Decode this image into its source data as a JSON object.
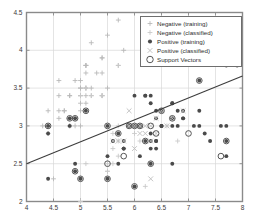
{
  "chart_data": {
    "type": "scatter",
    "title": "",
    "xlabel": "",
    "ylabel": "",
    "xlim": [
      4,
      8
    ],
    "ylim": [
      2,
      4.5
    ],
    "xticks": [
      4,
      4.5,
      5,
      5.5,
      6,
      6.5,
      7,
      7.5,
      8
    ],
    "xticklabels": [
      "4",
      "4.5",
      "5",
      "5.5",
      "6",
      "6.5",
      "7",
      "7.5",
      "8"
    ],
    "yticks": [
      2,
      2.5,
      3,
      3.5,
      4,
      4.5
    ],
    "yticklabels": [
      "2",
      "2.5",
      "3",
      "3.5",
      "4",
      "4.5"
    ],
    "grid": true,
    "legend_position": "upper right",
    "legend": [
      {
        "label": "Negative (training)",
        "marker": "plus",
        "color": "#b9b9b9"
      },
      {
        "label": "Negative (classified)",
        "marker": "plus",
        "color": "#c9c9c9"
      },
      {
        "label": "Positive (training)",
        "marker": "filled-circle",
        "color": "#4a4a4a"
      },
      {
        "label": "Positive (classified)",
        "marker": "cross",
        "color": "#bdbdbd"
      },
      {
        "label": "Support Vectors",
        "marker": "circle-outline",
        "color": "#555555"
      }
    ],
    "decision_boundary": {
      "type": "line",
      "x": [
        4,
        8
      ],
      "y": [
        2.5,
        3.66
      ],
      "color": "#3c3c3c"
    },
    "series": [
      {
        "name": "Negative (training)",
        "marker": "plus",
        "color": "#b9b9b9",
        "points": [
          [
            5.1,
            3.5
          ],
          [
            4.9,
            3.0
          ],
          [
            4.7,
            3.2
          ],
          [
            4.6,
            3.1
          ],
          [
            5.0,
            3.6
          ],
          [
            5.4,
            3.9
          ],
          [
            4.6,
            3.4
          ],
          [
            5.0,
            3.4
          ],
          [
            4.4,
            2.9
          ],
          [
            4.9,
            3.1
          ],
          [
            5.4,
            3.7
          ],
          [
            4.8,
            3.4
          ],
          [
            4.8,
            3.0
          ],
          [
            4.3,
            3.0
          ],
          [
            5.8,
            4.0
          ],
          [
            5.7,
            4.4
          ],
          [
            5.4,
            3.9
          ],
          [
            5.1,
            3.5
          ],
          [
            5.7,
            3.8
          ],
          [
            5.1,
            3.8
          ],
          [
            5.4,
            3.4
          ],
          [
            5.1,
            3.7
          ],
          [
            4.6,
            3.6
          ],
          [
            5.1,
            3.3
          ],
          [
            4.8,
            3.4
          ],
          [
            5.0,
            3.0
          ],
          [
            5.0,
            3.4
          ],
          [
            5.2,
            3.5
          ],
          [
            5.2,
            3.4
          ],
          [
            4.7,
            3.2
          ],
          [
            4.8,
            3.1
          ],
          [
            5.4,
            3.4
          ],
          [
            5.2,
            4.1
          ],
          [
            5.5,
            4.2
          ],
          [
            4.9,
            3.1
          ],
          [
            5.0,
            3.2
          ],
          [
            5.5,
            3.5
          ],
          [
            4.9,
            3.6
          ],
          [
            4.4,
            3.0
          ],
          [
            5.1,
            3.4
          ],
          [
            5.0,
            3.5
          ],
          [
            4.5,
            2.3
          ],
          [
            4.4,
            3.2
          ],
          [
            5.0,
            3.5
          ],
          [
            5.1,
            3.8
          ],
          [
            4.8,
            3.0
          ],
          [
            5.1,
            3.8
          ],
          [
            4.6,
            3.2
          ],
          [
            5.3,
            3.7
          ],
          [
            5.0,
            3.3
          ]
        ]
      },
      {
        "name": "Negative (classified)",
        "marker": "plus",
        "color": "#c9c9c9",
        "points": [
          [
            5.0,
            3.4
          ],
          [
            4.9,
            3.1
          ],
          [
            5.4,
            3.4
          ],
          [
            4.8,
            3.1
          ],
          [
            5.1,
            3.5
          ],
          [
            5.7,
            3.8
          ],
          [
            5.2,
            3.4
          ],
          [
            5.5,
            2.3
          ],
          [
            5.5,
            2.4
          ],
          [
            5.0,
            2.0
          ],
          [
            6.0,
            2.2
          ],
          [
            5.6,
            2.5
          ],
          [
            5.8,
            2.7
          ],
          [
            6.2,
            2.2
          ],
          [
            5.6,
            2.9
          ],
          [
            5.7,
            2.6
          ],
          [
            5.5,
            2.4
          ],
          [
            5.5,
            2.5
          ],
          [
            6.1,
            2.8
          ],
          [
            5.8,
            2.7
          ],
          [
            5.0,
            2.3
          ],
          [
            5.6,
            2.7
          ],
          [
            5.7,
            3.0
          ],
          [
            6.3,
            2.5
          ],
          [
            5.1,
            2.5
          ],
          [
            5.7,
            2.8
          ],
          [
            6.6,
            3.0
          ],
          [
            6.8,
            2.8
          ],
          [
            6.7,
            3.1
          ],
          [
            6.0,
            2.9
          ]
        ]
      },
      {
        "name": "Positive (training)",
        "marker": "filled-circle",
        "color": "#4a4a4a",
        "points": [
          [
            6.3,
            3.3
          ],
          [
            5.8,
            2.7
          ],
          [
            7.1,
            3.0
          ],
          [
            6.3,
            2.9
          ],
          [
            6.5,
            3.0
          ],
          [
            7.6,
            3.0
          ],
          [
            4.9,
            2.5
          ],
          [
            7.3,
            2.9
          ],
          [
            6.7,
            2.5
          ],
          [
            7.2,
            3.6
          ],
          [
            6.5,
            3.2
          ],
          [
            6.4,
            2.7
          ],
          [
            6.8,
            3.0
          ],
          [
            5.7,
            2.5
          ],
          [
            5.8,
            2.8
          ],
          [
            6.4,
            3.2
          ],
          [
            6.5,
            3.0
          ],
          [
            7.7,
            3.8
          ],
          [
            7.7,
            2.6
          ],
          [
            6.0,
            2.2
          ],
          [
            6.9,
            3.2
          ],
          [
            5.6,
            2.8
          ],
          [
            7.7,
            2.8
          ],
          [
            6.3,
            2.7
          ],
          [
            6.7,
            3.3
          ],
          [
            7.2,
            3.2
          ],
          [
            6.2,
            2.8
          ],
          [
            6.1,
            3.0
          ],
          [
            6.4,
            2.8
          ],
          [
            7.2,
            3.0
          ],
          [
            7.4,
            2.8
          ],
          [
            7.9,
            3.8
          ],
          [
            6.4,
            2.8
          ],
          [
            6.3,
            2.8
          ],
          [
            6.1,
            2.6
          ],
          [
            7.7,
            3.0
          ],
          [
            6.3,
            3.4
          ],
          [
            6.4,
            3.1
          ],
          [
            6.0,
            3.0
          ],
          [
            6.9,
            3.1
          ],
          [
            6.7,
            3.1
          ],
          [
            6.9,
            3.1
          ],
          [
            5.8,
            2.7
          ],
          [
            6.8,
            3.2
          ],
          [
            6.7,
            3.3
          ],
          [
            6.7,
            3.0
          ],
          [
            6.3,
            2.5
          ],
          [
            6.5,
            3.0
          ],
          [
            6.2,
            3.4
          ],
          [
            5.9,
            3.0
          ],
          [
            4.4,
            2.3
          ],
          [
            4.9,
            2.4
          ],
          [
            5.0,
            2.3
          ],
          [
            5.5,
            2.3
          ],
          [
            5.5,
            2.6
          ],
          [
            6.0,
            3.4
          ],
          [
            6.2,
            3.4
          ],
          [
            5.5,
            3.0
          ],
          [
            5.7,
            2.9
          ],
          [
            5.1,
            3.2
          ],
          [
            4.8,
            3.1
          ],
          [
            4.9,
            3.1
          ],
          [
            4.8,
            3.0
          ],
          [
            4.4,
            3.0
          ],
          [
            4.4,
            2.9
          ]
        ]
      },
      {
        "name": "Positive (classified)",
        "marker": "cross",
        "color": "#bdbdbd",
        "points": [
          [
            6.3,
            2.8
          ],
          [
            6.1,
            2.9
          ],
          [
            6.4,
            3.1
          ],
          [
            5.9,
            3.2
          ],
          [
            6.0,
            2.7
          ],
          [
            6.7,
            3.1
          ],
          [
            6.2,
            2.9
          ],
          [
            6.5,
            3.2
          ],
          [
            6.3,
            3.0
          ],
          [
            6.9,
            3.2
          ],
          [
            5.8,
            2.8
          ],
          [
            6.4,
            2.9
          ],
          [
            6.1,
            3.0
          ],
          [
            6.6,
            3.0
          ],
          [
            5.9,
            3.0
          ],
          [
            6.2,
            3.0
          ],
          [
            5.7,
            2.8
          ],
          [
            6.0,
            3.0
          ],
          [
            6.3,
            2.3
          ],
          [
            5.6,
            2.8
          ]
        ]
      },
      {
        "name": "Support Vectors",
        "marker": "circle-outline",
        "color": "#555555",
        "points": [
          [
            5.5,
            3.0
          ],
          [
            5.7,
            2.9
          ],
          [
            6.0,
            3.0
          ],
          [
            6.1,
            3.0
          ],
          [
            6.3,
            3.0
          ],
          [
            6.5,
            3.2
          ],
          [
            6.7,
            3.1
          ],
          [
            5.9,
            3.0
          ],
          [
            6.2,
            2.8
          ],
          [
            6.4,
            2.9
          ],
          [
            5.1,
            3.2
          ],
          [
            4.9,
            3.1
          ],
          [
            4.8,
            3.1
          ],
          [
            4.4,
            3.0
          ],
          [
            5.0,
            2.3
          ],
          [
            4.9,
            2.4
          ],
          [
            5.5,
            2.3
          ],
          [
            6.0,
            2.2
          ],
          [
            5.5,
            2.5
          ],
          [
            5.8,
            2.6
          ],
          [
            6.3,
            2.5
          ],
          [
            7.0,
            2.9
          ],
          [
            7.7,
            2.8
          ],
          [
            7.6,
            2.6
          ],
          [
            7.2,
            3.6
          ]
        ]
      }
    ]
  },
  "axes": {
    "frame_color": "#8a8a8a",
    "grid_color": "#d8d8d8"
  }
}
